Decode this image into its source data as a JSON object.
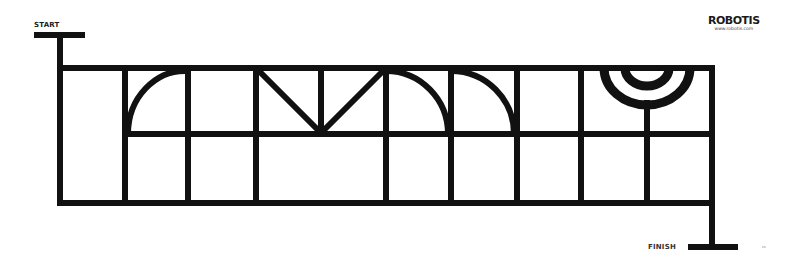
{
  "labels": {
    "start": "START",
    "finish": "FINISH",
    "brand_name": "ROBOTIS",
    "brand_url": "www.robotis.com",
    "tiny_mark": "co"
  },
  "track": {
    "color": "#111111",
    "background": "#ffffff",
    "stroke_width": 6,
    "top_y": 68,
    "mid_y": 134,
    "bottom_y": 203,
    "verticals_x": [
      60,
      125,
      188,
      256,
      386,
      451,
      517,
      581,
      647,
      712
    ]
  }
}
